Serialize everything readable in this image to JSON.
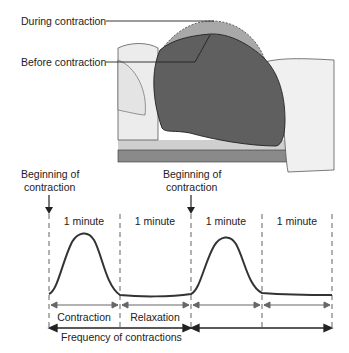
{
  "illustration": {
    "label_during": "During contraction",
    "label_before": "Before contraction"
  },
  "graph": {
    "beginning_1_line1": "Beginning of",
    "beginning_1_line2": "contraction",
    "beginning_2_line1": "Beginning of",
    "beginning_2_line2": "contraction",
    "minutes": [
      "1 minute",
      "1 minute",
      "1 minute",
      "1 minute"
    ],
    "phase_contraction": "Contraction",
    "phase_relaxation": "Relaxation",
    "frequency_label": "Frequency of contractions"
  },
  "colors": {
    "uterus": "#5f5f5f",
    "uterus_during": "#a8a8a8",
    "body": "#ececec",
    "bed": "#7a7a7a",
    "line": "#222222",
    "dash": "#888888"
  }
}
